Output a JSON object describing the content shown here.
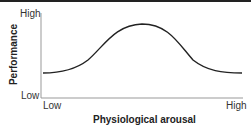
{
  "diagram": {
    "title": "",
    "y_axis": {
      "title": "Performance",
      "high_label": "High",
      "low_label": "Low"
    },
    "x_axis": {
      "title": "Physiological arousal",
      "low_label": "Low",
      "high_label": "High"
    },
    "curve": "inverted-U (Yerkes-Dodson)",
    "colors": {
      "axis": "#999999",
      "curve": "#222222",
      "border": "#222222"
    }
  }
}
